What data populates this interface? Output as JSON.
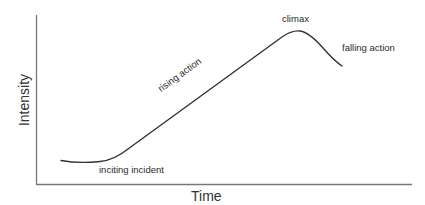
{
  "diagram": {
    "title": "",
    "type": "story-arc",
    "axes": {
      "x_label": "Time",
      "y_label": "Intensity"
    },
    "annotations": {
      "inciting_incident": "inciting incident",
      "rising_action": "rising action",
      "climax": "climax",
      "falling_action": "falling action"
    },
    "colors": {
      "axis": "#777777",
      "curve": "#333333",
      "text": "#2a2a2a"
    }
  }
}
